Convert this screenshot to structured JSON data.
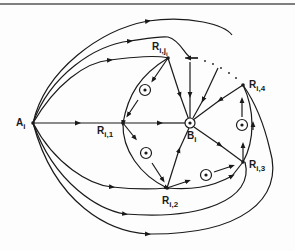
{
  "diagram": {
    "stroke_color": "#1a1a1a",
    "background": "#fdfdfd",
    "nodes": [
      {
        "id": "A_i",
        "label": "A",
        "sub": "i",
        "x": 33,
        "y": 123
      },
      {
        "id": "R_i1",
        "label": "R",
        "sub": "i,1",
        "x": 123,
        "y": 123
      },
      {
        "id": "B_i",
        "label": "B",
        "sub": "i",
        "x": 190,
        "y": 123
      },
      {
        "id": "R_iji",
        "label": "R",
        "sub": "i,j",
        "subsub": "i",
        "x": 168,
        "y": 58
      },
      {
        "id": "R_i2",
        "label": "R",
        "sub": "i,2",
        "x": 167,
        "y": 188
      },
      {
        "id": "R_i3",
        "label": "R",
        "sub": "i,3",
        "x": 243,
        "y": 162
      },
      {
        "id": "R_i4",
        "label": "R",
        "sub": "i,4",
        "x": 243,
        "y": 85
      }
    ],
    "circled_nodes": [
      {
        "between": [
          "R_iji",
          "R_i1"
        ],
        "x": 145,
        "y": 90
      },
      {
        "between": [
          "R_i1",
          "R_i2"
        ],
        "x": 146,
        "y": 153
      },
      {
        "between": [
          "R_i2",
          "R_i3"
        ],
        "x": 206,
        "y": 175
      },
      {
        "between": [
          "R_i3",
          "R_i4"
        ],
        "x": 242,
        "y": 125
      }
    ],
    "ellipsis": "· · · · ·"
  }
}
